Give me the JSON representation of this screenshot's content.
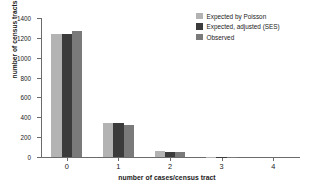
{
  "chart_data": {
    "type": "bar",
    "title": "",
    "xlabel": "number of cases/census tract",
    "ylabel": "number of census tracts",
    "categories": [
      "0",
      "1",
      "2",
      "3",
      "4"
    ],
    "series": [
      {
        "name": "Expected by Poisson",
        "color": "#b3b3b3",
        "values": [
          1240,
          340,
          60,
          3,
          0
        ]
      },
      {
        "name": "Expected, adjusted (SES)",
        "color": "#3b3b3b",
        "values": [
          1240,
          340,
          55,
          3,
          0
        ]
      },
      {
        "name": "Observed",
        "color": "#7a7a7a",
        "values": [
          1270,
          318,
          50,
          2,
          0
        ]
      }
    ],
    "ylim": [
      0,
      1400
    ],
    "yticks": [
      0,
      200,
      400,
      600,
      800,
      1000,
      1200,
      1400
    ],
    "ytick_labels": [
      "0",
      "200",
      "400",
      "600",
      "800",
      "1000",
      "1200",
      "1400"
    ],
    "grid": false,
    "legend_position": "top-right"
  },
  "legend": {
    "items": [
      {
        "label": "Expected by Poisson"
      },
      {
        "label": "Expected, adjusted (SES)"
      },
      {
        "label": "Observed"
      }
    ]
  },
  "colors": {
    "axis": "#6b6b6b",
    "text": "#1a1a1a",
    "background": "#ffffff"
  }
}
